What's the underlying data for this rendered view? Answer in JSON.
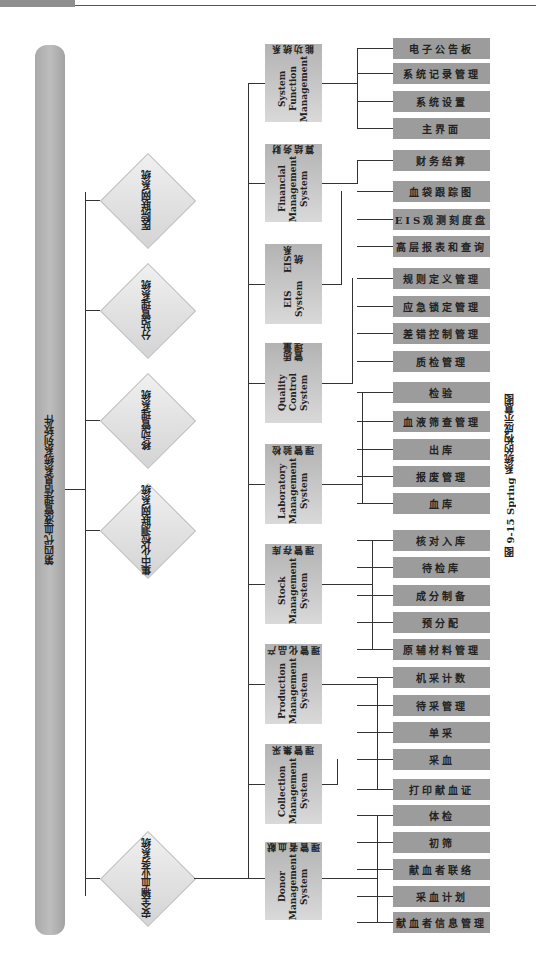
{
  "root": {
    "label": "第四代血液管理信息系统系列软件"
  },
  "caption": "图 9-15  Spring 系统的构成示意图",
  "subsystems": [
    {
      "label": "医院联网系统"
    },
    {
      "label": "分站管理系统"
    },
    {
      "label": "移动管理系统"
    },
    {
      "label": "集中化检测联网系统"
    },
    {
      "label": "安全输血业务系统"
    }
  ],
  "modules": [
    {
      "en": "System Function Management",
      "cn": "系统功能",
      "leaves": [
        "电子公告板",
        "系统记录管理",
        "系统设置",
        "主界面"
      ]
    },
    {
      "en": "Financial Management System",
      "cn": "财务结算",
      "leaves": [
        "财务结算"
      ]
    },
    {
      "en": "EIS System",
      "cn": "EIS系统",
      "leaves": [
        "血袋跟踪图",
        "EIS观测刻度盘",
        "高层报表和查询"
      ]
    },
    {
      "en": "Quality Control System",
      "cn": "质量管理",
      "leaves": [
        "规则定义管理",
        "应急锁定管理",
        "差错控制管理",
        "质检管理"
      ]
    },
    {
      "en": "Laboratory Management System",
      "cn": "检验管理",
      "leaves": [
        "检验",
        "血液筛查管理",
        "出库",
        "报废管理",
        "血库"
      ]
    },
    {
      "en": "Stock Management System",
      "cn": "库存管理",
      "leaves": [
        "核对入库",
        "待检库",
        "成分制备",
        "预分配",
        "原辅材料管理"
      ]
    },
    {
      "en": "Production Management System",
      "cn": "产品化管理",
      "leaves": [
        "机采计数",
        "待采管理",
        "单采",
        "采血",
        "打印献血证"
      ]
    },
    {
      "en": "Collection Management System",
      "cn": "采集管理",
      "leaves": [
        "体检",
        "初筛",
        "献血者联络",
        "采血计划",
        "献血者信息管理"
      ]
    },
    {
      "en": "Donor Management System",
      "cn": "献血者管理",
      "leaves": []
    }
  ]
}
